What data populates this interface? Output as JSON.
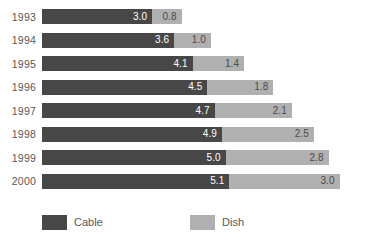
{
  "chart_data": {
    "type": "bar",
    "orientation": "horizontal",
    "stacked": true,
    "title": "",
    "subtitle": "",
    "xlabel": "",
    "ylabel": "",
    "grid": false,
    "legend_position": "bottom",
    "categories": [
      "1993",
      "1994",
      "1995",
      "1996",
      "1997",
      "1998",
      "1999",
      "2000"
    ],
    "series": [
      {
        "name": "Cable",
        "color": "#474747",
        "values": [
          3.0,
          3.6,
          4.1,
          4.5,
          4.7,
          4.9,
          5.0,
          5.1
        ],
        "labels": [
          "3.0",
          "3.6",
          "4.1",
          "4.5",
          "4.7",
          "4.9",
          "5.0",
          "5.1"
        ]
      },
      {
        "name": "Dish",
        "color": "#b0b0b0",
        "values": [
          0.8,
          1.0,
          1.4,
          1.8,
          2.1,
          2.5,
          2.8,
          3.0
        ],
        "labels": [
          "0.8",
          "1.0",
          "1.4",
          "1.8",
          "2.1",
          "2.5",
          "2.8",
          "3.0"
        ]
      }
    ],
    "totals": [
      3.8,
      4.6,
      5.5,
      6.3,
      6.8,
      7.4,
      7.8,
      8.1
    ],
    "xlim": [
      0,
      8.6
    ]
  },
  "legend": {
    "items": [
      {
        "label": "Cable",
        "color": "#474747"
      },
      {
        "label": "Dish",
        "color": "#b0b0b0"
      }
    ]
  },
  "colors": {
    "cable": "#474747",
    "dish": "#b0b0b0",
    "text": "#58585a",
    "background": "#ffffff"
  }
}
